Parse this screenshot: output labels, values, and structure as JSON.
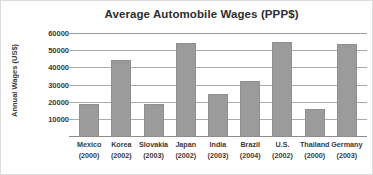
{
  "chart_data": {
    "type": "bar",
    "title": "Average Automobile Wages (PPP$)",
    "xlabel": "",
    "ylabel": "Annual Wages (US$)",
    "categories": [
      "Mexico (2000)",
      "Korea (2002)",
      "Slovakia (2003)",
      "Japan (2002)",
      "India (2003)",
      "Brazil (2004)",
      "U.S. (2002)",
      "Thailand (2000)",
      "Germany (2003)"
    ],
    "category_names": [
      "Mexico",
      "Korea",
      "Slovakia",
      "Japan",
      "India",
      "Brazil",
      "U.S.",
      "Thailand",
      "Germany"
    ],
    "category_years": [
      "(2000)",
      "(2002)",
      "(2003)",
      "(2002)",
      "(2003)",
      "(2004)",
      "(2002)",
      "(2000)",
      "(2003)"
    ],
    "values": [
      18500,
      44000,
      18500,
      54000,
      24500,
      32000,
      55000,
      15500,
      53500
    ],
    "ylim": [
      0,
      60000
    ],
    "yticks": [
      10000,
      20000,
      30000,
      40000,
      50000,
      60000
    ],
    "ytick_labels": [
      "10000",
      "20000",
      "30000",
      "40000",
      "50000",
      "60000"
    ],
    "grid": true,
    "grid_axis": "y",
    "legend": false,
    "bar_color": "#9b9b9b",
    "gridline_color": "#a9a9a9",
    "text_color": "#3a3a3a",
    "background_color": "#ffffff"
  }
}
